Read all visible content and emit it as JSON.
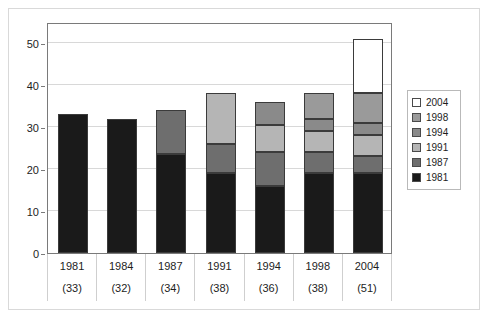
{
  "chart_data": {
    "type": "bar",
    "subtype": "stacked-vertical",
    "title": "",
    "xlabel": "",
    "ylabel": "",
    "ylim": [
      0,
      55
    ],
    "ytick_values": [
      0,
      10,
      20,
      30,
      40,
      50
    ],
    "ytick_labels": [
      "0",
      "10",
      "20",
      "30",
      "40",
      "50"
    ],
    "grid": true,
    "grid_axis": "y",
    "legend_position": "right",
    "categories": [
      "1981",
      "1984",
      "1987",
      "1991",
      "1994",
      "1998",
      "2004"
    ],
    "category_totals": [
      33,
      32,
      34,
      38,
      36,
      38,
      51
    ],
    "category_total_labels": [
      "(33)",
      "(32)",
      "(34)",
      "(38)",
      "(36)",
      "(38)",
      "(51)"
    ],
    "series": [
      {
        "name": "1981",
        "color": "#1a1a1a",
        "values": [
          33,
          32,
          23.5,
          19,
          16,
          19,
          19
        ]
      },
      {
        "name": "1987",
        "color": "#6e6e6e",
        "values": [
          0,
          0,
          10.5,
          7,
          8,
          5,
          4
        ]
      },
      {
        "name": "1991",
        "color": "#b5b5b5",
        "values": [
          0,
          0,
          0,
          12,
          6.5,
          5,
          5
        ]
      },
      {
        "name": "1994",
        "color": "#8a8a8a",
        "values": [
          0,
          0,
          0,
          0,
          5.5,
          3,
          3
        ]
      },
      {
        "name": "1998",
        "color": "#9a9a9a",
        "values": [
          0,
          0,
          0,
          0,
          0,
          6,
          7
        ]
      },
      {
        "name": "2004",
        "color": "#ffffff",
        "values": [
          0,
          0,
          0,
          0,
          0,
          0,
          13
        ]
      }
    ],
    "legend_entries": [
      {
        "label": "2004",
        "color": "#ffffff"
      },
      {
        "label": "1998",
        "color": "#9a9a9a"
      },
      {
        "label": "1994",
        "color": "#8a8a8a"
      },
      {
        "label": "1991",
        "color": "#b5b5b5"
      },
      {
        "label": "1987",
        "color": "#6e6e6e"
      },
      {
        "label": "1981",
        "color": "#1a1a1a"
      }
    ]
  }
}
